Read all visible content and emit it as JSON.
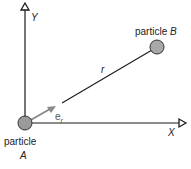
{
  "diagram": {
    "axes": {
      "x_label": "X",
      "y_label": "Y"
    },
    "particles": [
      {
        "id": "A",
        "label_prefix": "particle",
        "label_name": "A",
        "cx": 25,
        "cy": 123
      },
      {
        "id": "B",
        "label_prefix": "particle",
        "label_name": "B",
        "cx": 157,
        "cy": 47
      }
    ],
    "vector": {
      "name": "r",
      "unit_vector_base": "e",
      "unit_vector_sub": "r"
    },
    "colors": {
      "line": "#1a1a1a",
      "particle_fill": "#9a9a9a",
      "particle_stroke": "#333333",
      "unit_vector": "#8a8a8a",
      "text": "#222222"
    }
  }
}
